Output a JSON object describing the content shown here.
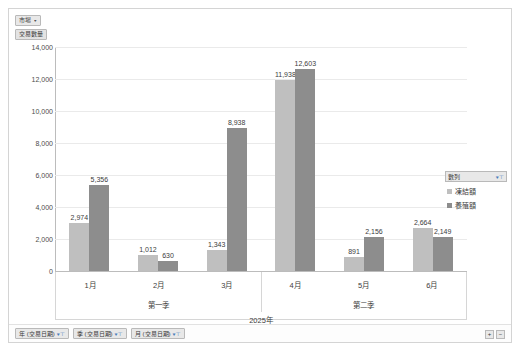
{
  "window": {
    "title": "樞紐分析圖"
  },
  "fields": {
    "filter_field": "市場",
    "value_field": "交易數量",
    "axis_buttons": [
      "年 (交易日期)",
      "季 (交易日期)",
      "月 (交易日期)"
    ],
    "caret_icon": "▾",
    "filter_icon": "funnel-icon"
  },
  "legend": {
    "header": "數列",
    "header_caret": "▾",
    "items": [
      {
        "label": "凍結額",
        "color": "#bfbfbf"
      },
      {
        "label": "養殖額",
        "color": "#8d8d8d"
      }
    ]
  },
  "zoom_controls": {
    "zoom_in": "+",
    "zoom_out": "−"
  },
  "chart_data": {
    "type": "bar",
    "title": "",
    "xlabel": "",
    "ylabel": "交易數量",
    "categories": [
      "1月",
      "2月",
      "3月",
      "4月",
      "5月",
      "6月"
    ],
    "group_labels": {
      "quarters": [
        "第一季",
        "第二季"
      ],
      "year": "2025年"
    },
    "series": [
      {
        "name": "凍結額",
        "color": "#bfbfbf",
        "values": [
          2974,
          1012,
          1343,
          11938,
          891,
          2664
        ]
      },
      {
        "name": "養殖額",
        "color": "#8d8d8d",
        "values": [
          5356,
          630,
          8938,
          12603,
          2156,
          2149
        ]
      }
    ],
    "ylim": [
      0,
      14000
    ],
    "yticks": [
      "0",
      "2,000",
      "4,000",
      "6,000",
      "8,000",
      "10,000",
      "12,000",
      "14,000"
    ],
    "ytick_values": [
      0,
      2000,
      4000,
      6000,
      8000,
      10000,
      12000,
      14000
    ],
    "data_labels": [
      "2,974",
      "5,356",
      "1,012",
      "630",
      "1,343",
      "8,938",
      "11,938",
      "12,603",
      "891",
      "2,156",
      "2,664",
      "2,149"
    ],
    "grid": true,
    "legend_position": "right"
  }
}
